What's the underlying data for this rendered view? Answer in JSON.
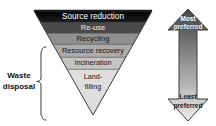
{
  "diagram": {
    "type": "inverted-triangle-hierarchy",
    "background_color": "#ffffff",
    "outline_color": "#333333"
  },
  "pyramid": {
    "shape": "inverted-triangle",
    "bands": [
      {
        "label": "Source reduction",
        "fill": "#0a0a0a",
        "text_color": "#ffffff",
        "order": 1
      },
      {
        "label": "Re-use",
        "fill": "#4a4a4a",
        "text_color": "#f2f2f2",
        "order": 2
      },
      {
        "label": "Recycling",
        "fill": "#8c8c8c",
        "text_color": "#1a1a1a",
        "order": 3
      },
      {
        "label": "Resource recovery",
        "fill": "#a8a8a8",
        "text_color": "#1a1a1a",
        "order": 4
      },
      {
        "label": "Incineration",
        "fill": "#c2c2c2",
        "text_color": "#1a1a1a",
        "order": 5
      },
      {
        "label_line1": "Land-",
        "label_line2": "filling",
        "fill": "#dcdcdc",
        "text_color": "#1a1a1a",
        "order": 6
      }
    ]
  },
  "brace": {
    "label_line1": "Waste",
    "label_line2": "disposal",
    "covers_bands": [
      "Resource recovery",
      "Incineration",
      "Land-filling"
    ],
    "color": "#333333"
  },
  "preference_arrow": {
    "type": "double-headed-vertical-arrow",
    "top_label_line1": "Most",
    "top_label_line2": "preferred",
    "bottom_label_line1": "Least",
    "bottom_label_line2": "preferred",
    "top_fill": "#4f4f4f",
    "bottom_fill": "#e8e8e8",
    "outline": "#333333",
    "top_text_color": "#ffffff",
    "bottom_text_color": "#1a1a1a"
  }
}
